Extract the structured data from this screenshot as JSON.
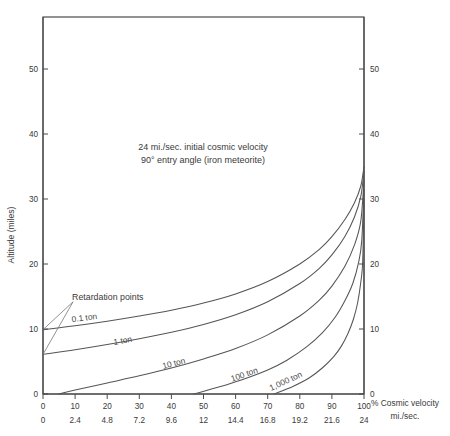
{
  "chart_data": {
    "type": "line",
    "title": "24 mi./sec. initial cosmic velocity",
    "subtitle": "90° entry angle (iron meteorite)",
    "xlabel": "% Cosmic velocity",
    "xlabel_line2": "mi./sec.",
    "ylabel": "Altitude (miles)",
    "ylabel_right": "Altitude (miles)",
    "xlim": [
      0,
      100
    ],
    "ylim": [
      0,
      58
    ],
    "grid": false,
    "legend_position": "inline-curve-labels",
    "x_ticks_percent": [
      "0",
      "10",
      "20",
      "30",
      "40",
      "50",
      "60",
      "70",
      "80",
      "90",
      "100"
    ],
    "x_ticks_velocity": [
      "0",
      "2.4",
      "4.8",
      "7.2",
      "9.6",
      "12",
      "14.4",
      "16.8",
      "19.2",
      "21.6",
      "24"
    ],
    "y_ticks_left": [
      "0",
      "10",
      "20",
      "30",
      "40",
      "50"
    ],
    "y_ticks_right": [
      "0",
      "10",
      "20",
      "30",
      "40",
      "50"
    ],
    "annotations": [
      {
        "text": "Retardation points",
        "x_percent": 10,
        "y_miles": 14.5
      }
    ],
    "series": [
      {
        "name": "0.1 ton",
        "label": "0.1 ton",
        "label_x_percent": 13,
        "label_y_miles": 11.3,
        "retardation_point": {
          "x_percent": 0,
          "y_miles": 9.9
        },
        "points": [
          [
            0,
            9.9
          ],
          [
            10,
            10.5
          ],
          [
            20,
            11.2
          ],
          [
            30,
            12.0
          ],
          [
            40,
            12.9
          ],
          [
            50,
            14.0
          ],
          [
            60,
            15.4
          ],
          [
            70,
            17.3
          ],
          [
            80,
            20.0
          ],
          [
            86,
            22.2
          ],
          [
            90,
            24.2
          ],
          [
            94,
            26.8
          ],
          [
            97,
            29.4
          ],
          [
            99,
            32.0
          ],
          [
            100,
            35.0
          ]
        ]
      },
      {
        "name": "1 ton",
        "label": "1 ton",
        "label_x_percent": 25,
        "label_y_miles": 7.8,
        "retardation_point": {
          "x_percent": 0,
          "y_miles": 6.1
        },
        "points": [
          [
            0,
            6.1
          ],
          [
            10,
            6.8
          ],
          [
            20,
            7.6
          ],
          [
            30,
            8.5
          ],
          [
            40,
            9.5
          ],
          [
            50,
            10.7
          ],
          [
            60,
            12.2
          ],
          [
            70,
            14.2
          ],
          [
            80,
            17.0
          ],
          [
            86,
            19.3
          ],
          [
            90,
            21.4
          ],
          [
            94,
            24.2
          ],
          [
            97,
            27.2
          ],
          [
            99,
            30.4
          ],
          [
            100,
            34.3
          ]
        ]
      },
      {
        "name": "10 ton",
        "label": "10 ton",
        "label_x_percent": 41,
        "label_y_miles": 4.3,
        "retardation_point": {
          "x_percent": 5,
          "y_miles": 0
        },
        "points": [
          [
            5,
            0
          ],
          [
            10,
            0.6
          ],
          [
            20,
            1.7
          ],
          [
            30,
            2.8
          ],
          [
            40,
            4.0
          ],
          [
            50,
            5.4
          ],
          [
            60,
            7.0
          ],
          [
            70,
            9.1
          ],
          [
            80,
            12.0
          ],
          [
            86,
            14.4
          ],
          [
            90,
            16.6
          ],
          [
            94,
            19.6
          ],
          [
            97,
            22.9
          ],
          [
            99,
            26.6
          ],
          [
            100,
            33.0
          ]
        ]
      },
      {
        "name": "100 ton",
        "label": "100 ton",
        "label_x_percent": 63,
        "label_y_miles": 2.6,
        "retardation_point": {
          "x_percent": 47,
          "y_miles": 0
        },
        "points": [
          [
            47,
            0
          ],
          [
            55,
            1.1
          ],
          [
            62,
            2.2
          ],
          [
            70,
            3.7
          ],
          [
            76,
            5.2
          ],
          [
            82,
            7.2
          ],
          [
            87,
            9.4
          ],
          [
            91,
            11.8
          ],
          [
            94,
            14.3
          ],
          [
            96.5,
            17.0
          ],
          [
            98.3,
            20.2
          ],
          [
            99.3,
            23.6
          ],
          [
            100,
            31.5
          ]
        ]
      },
      {
        "name": "1,000 ton",
        "label": "1,000 ton",
        "label_x_percent": 76,
        "label_y_miles": 1.6,
        "retardation_point": {
          "x_percent": 72,
          "y_miles": 0
        },
        "points": [
          [
            72,
            0
          ],
          [
            78,
            1.2
          ],
          [
            83,
            2.5
          ],
          [
            87,
            4.0
          ],
          [
            90.5,
            5.7
          ],
          [
            93,
            7.4
          ],
          [
            95,
            9.3
          ],
          [
            96.7,
            11.5
          ],
          [
            98,
            14.0
          ],
          [
            99,
            17.2
          ],
          [
            99.6,
            20.5
          ],
          [
            100,
            30.0
          ]
        ]
      }
    ]
  }
}
